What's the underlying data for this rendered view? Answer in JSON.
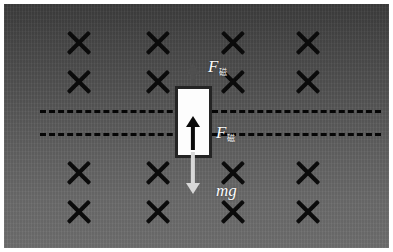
{
  "figure": {
    "canvas": {
      "width": 393,
      "height": 252
    },
    "frame_color": "#ffffff"
  },
  "field_region": {
    "name": "magnetic-field-into-page",
    "gradient_top_color": "#3c3c3c",
    "gradient_bottom_color": "#6e6e6e",
    "symbol": "×",
    "symbol_color": "#0b0b0b",
    "symbol_meaning": "magnetic field into the page",
    "rows": 4,
    "columns": 4,
    "marks": [
      {
        "x": 79,
        "y": 43
      },
      {
        "x": 158,
        "y": 43
      },
      {
        "x": 233,
        "y": 43
      },
      {
        "x": 308,
        "y": 43
      },
      {
        "x": 79,
        "y": 82
      },
      {
        "x": 158,
        "y": 82
      },
      {
        "x": 233,
        "y": 82
      },
      {
        "x": 308,
        "y": 82
      },
      {
        "x": 79,
        "y": 173
      },
      {
        "x": 158,
        "y": 173
      },
      {
        "x": 233,
        "y": 173
      },
      {
        "x": 308,
        "y": 173
      },
      {
        "x": 79,
        "y": 212
      },
      {
        "x": 158,
        "y": 212
      },
      {
        "x": 233,
        "y": 212
      },
      {
        "x": 308,
        "y": 212
      }
    ]
  },
  "rails": {
    "name": "conducting-rails",
    "color": "#060606",
    "style": "dashed",
    "lines": [
      {
        "y": 110
      },
      {
        "y": 133
      }
    ]
  },
  "rod": {
    "name": "conductor-rod",
    "fill_color": "#fdfdfd",
    "border_color": "#242424",
    "x": 175,
    "y": 86,
    "width": 37,
    "height": 72
  },
  "vectors": [
    {
      "id": "magnetic-force",
      "label_base": "F",
      "label_sub": "磁",
      "direction": "up",
      "color": "#4f4f4f",
      "label_color": "#fbfbfb",
      "label_x": 208,
      "label_y": 58,
      "arrow_x": 193,
      "arrow_top": 63,
      "arrow_height": 28
    },
    {
      "id": "current-direction",
      "label_base": "",
      "label_sub": "",
      "direction": "up",
      "color": "#0b0b0b",
      "arrow_x": 193,
      "arrow_top": 116,
      "arrow_height": 34
    },
    {
      "id": "magnetic-force-lower-label",
      "label_base": "F",
      "label_sub": "磁",
      "direction": "none",
      "label_color": "#fbfbfb",
      "label_x": 216,
      "label_y": 124
    },
    {
      "id": "gravity",
      "label_base": "mg",
      "label_sub": "",
      "direction": "down",
      "color": "#d8d8d8",
      "label_color": "#fbfbfb",
      "label_x": 216,
      "label_y": 182,
      "arrow_x": 193,
      "arrow_top": 152,
      "arrow_height": 42
    }
  ]
}
